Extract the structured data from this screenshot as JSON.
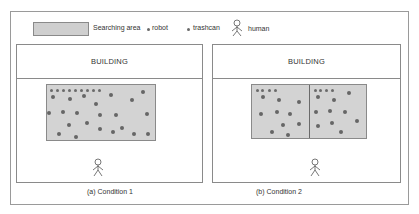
{
  "legend": {
    "searching_area_label": "Searching area",
    "robot_label": "robot",
    "trashcan_label": "trashcan",
    "human_label": "human"
  },
  "colors": {
    "area_fill": "#d3d3d3",
    "border": "#8a8a8a",
    "dot": "#666666",
    "text": "#333333"
  },
  "panels": [
    {
      "header": "BUILDING",
      "caption": "(a) Condition 1",
      "searching_areas": 1,
      "robots": 9,
      "trashcans": 22
    },
    {
      "header": "BUILDING",
      "caption": "(b) Condition 2",
      "searching_areas": 2,
      "robots": 8,
      "trashcans": 20
    }
  ]
}
